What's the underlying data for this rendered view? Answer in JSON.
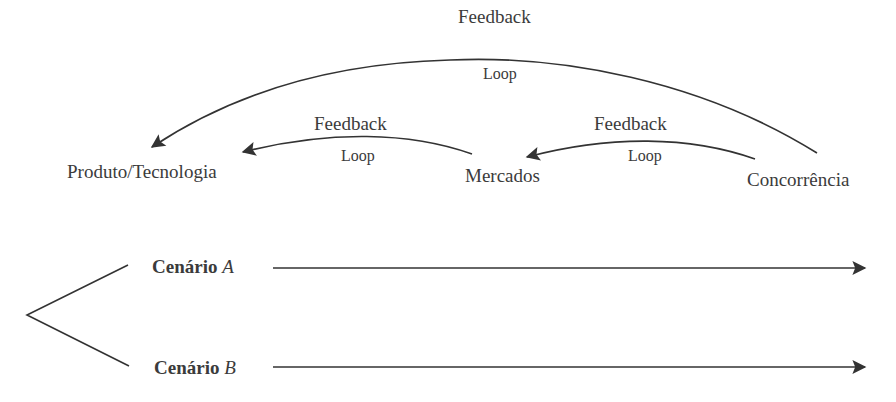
{
  "diagram": {
    "nodes": [
      {
        "id": "produto",
        "label": "Produto/Tecnologia"
      },
      {
        "id": "mercados",
        "label": "Mercados"
      },
      {
        "id": "concorrencia",
        "label": "Concorrência"
      }
    ],
    "loops": [
      {
        "from": "concorrencia",
        "to": "produto",
        "label_top": "Feedback",
        "label_bottom": "Loop"
      },
      {
        "from": "mercados",
        "to": "produto",
        "label_top": "Feedback",
        "label_bottom": "Loop"
      },
      {
        "from": "concorrencia",
        "to": "mercados",
        "label_top": "Feedback",
        "label_bottom": "Loop"
      }
    ],
    "scenarios": [
      {
        "prefix": "Cenário",
        "letter": "A"
      },
      {
        "prefix": "Cenário",
        "letter": "B"
      }
    ],
    "colors": {
      "line": "#333333",
      "text": "#3b3b3b",
      "background": "#ffffff"
    }
  }
}
